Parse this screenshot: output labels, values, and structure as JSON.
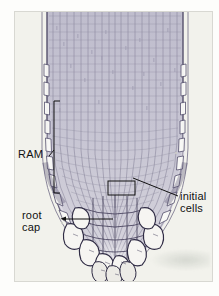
{
  "figure": {
    "type": "micrograph-diagram",
    "background_color": "#f2f2ec",
    "page_color": "#fdfdfb",
    "border_color": "#d8d8d2",
    "tissue_color": "#b9b8c8",
    "tissue_dark": "#4a465e",
    "ink_color": "#111111"
  },
  "labels": {
    "ram": {
      "text": "RAM",
      "description": "root apical meristem bracket label, left side"
    },
    "root_cap": {
      "line1": "root",
      "line2": "cap",
      "description": "root cap label with arrow leader, lower left"
    },
    "initial_cells": {
      "line1": "initial",
      "line2": "cells",
      "description": "initial cells label with leader to boxed quiescent centre, right side"
    }
  },
  "annotations": {
    "ram_bracket": {
      "name": "ram-bracket",
      "top_y": 101,
      "bottom_y": 193,
      "x": 54
    },
    "initials_box": {
      "name": "initial-cells-box",
      "x": 107,
      "y": 180,
      "width": 27,
      "height": 14
    },
    "root_cap_arrow": {
      "name": "root-cap-arrow",
      "from_x": 59,
      "to_x": 112,
      "y": 219
    }
  }
}
